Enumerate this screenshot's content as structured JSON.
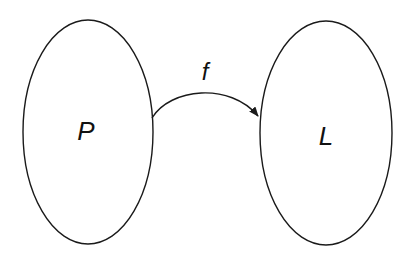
{
  "diagram": {
    "type": "mapping",
    "nodes": [
      {
        "id": "P",
        "label": "P",
        "shape": "ellipse"
      },
      {
        "id": "L",
        "label": "L",
        "shape": "ellipse"
      }
    ],
    "edges": [
      {
        "from": "P",
        "to": "L",
        "label": "f",
        "directed": true
      }
    ],
    "colors": {
      "stroke": "#1a1a1a",
      "text": "#111111",
      "background": "#ffffff"
    }
  }
}
